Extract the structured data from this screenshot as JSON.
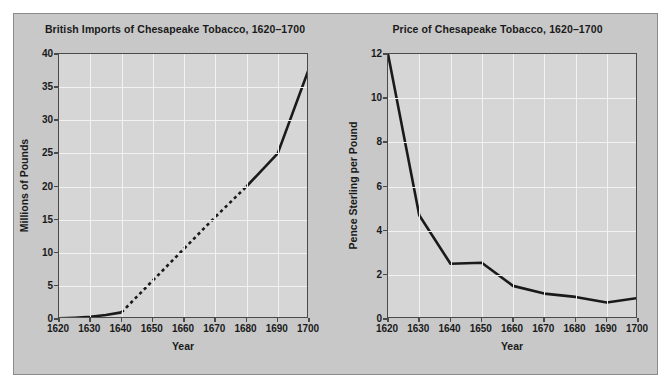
{
  "figure": {
    "background_color": "#c8c8c8",
    "plot_background_color": "#d6d6d6",
    "gridline_color": "#f2f2f2",
    "line_color": "#1a1a1a",
    "axis_color": "#4a4a4a"
  },
  "charts": [
    {
      "id": "imports",
      "title": "British Imports of Chesapeake Tobacco, 1620–1700",
      "xlabel": "Year",
      "ylabel": "Millions of Pounds"
    },
    {
      "id": "price",
      "title": "Price of Chesapeake Tobacco, 1620–1700",
      "xlabel": "Year",
      "ylabel": "Pence Sterling per Pound"
    }
  ],
  "chart_data": [
    {
      "type": "line",
      "title": "British Imports of Chesapeake Tobacco, 1620–1700",
      "xlabel": "Year",
      "ylabel": "Millions of Pounds",
      "xlim": [
        1620,
        1700
      ],
      "ylim": [
        0,
        40
      ],
      "xticks": [
        1620,
        1630,
        1640,
        1650,
        1660,
        1670,
        1680,
        1690,
        1700
      ],
      "yticks": [
        0,
        5,
        10,
        15,
        20,
        25,
        30,
        35,
        40
      ],
      "grid": true,
      "legend": "none",
      "series": [
        {
          "name": "Imports (observed, early)",
          "style": "solid",
          "x": [
            1620,
            1625,
            1630,
            1635,
            1640
          ],
          "values": [
            0.1,
            0.2,
            0.35,
            0.6,
            1.0
          ]
        },
        {
          "name": "Imports (interpolated)",
          "style": "dashed",
          "x": [
            1640,
            1650,
            1660,
            1670,
            1680
          ],
          "values": [
            1.0,
            5.8,
            10.6,
            15.4,
            20.0
          ]
        },
        {
          "name": "Imports (observed, late)",
          "style": "solid",
          "x": [
            1680,
            1690,
            1700
          ],
          "values": [
            20.0,
            25.0,
            37.8
          ]
        }
      ]
    },
    {
      "type": "line",
      "title": "Price of Chesapeake Tobacco, 1620–1700",
      "xlabel": "Year",
      "ylabel": "Pence Sterling per Pound",
      "xlim": [
        1620,
        1700
      ],
      "ylim": [
        0,
        12
      ],
      "xticks": [
        1620,
        1630,
        1640,
        1650,
        1660,
        1670,
        1680,
        1690,
        1700
      ],
      "yticks": [
        0,
        2,
        4,
        6,
        8,
        10,
        12
      ],
      "grid": true,
      "legend": "none",
      "series": [
        {
          "name": "Price",
          "style": "solid",
          "x": [
            1620,
            1630,
            1640,
            1650,
            1660,
            1670,
            1680,
            1690,
            1700
          ],
          "values": [
            12.0,
            4.7,
            2.5,
            2.55,
            1.5,
            1.15,
            1.0,
            0.75,
            0.95
          ]
        }
      ]
    }
  ]
}
